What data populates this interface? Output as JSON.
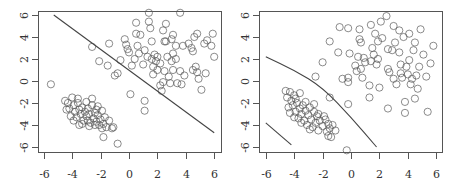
{
  "chart_data": [
    {
      "type": "scatter",
      "title": "",
      "xlabel": "",
      "ylabel": "",
      "xlim": [
        -6.5,
        6.5
      ],
      "ylim": [
        -6.5,
        6.5
      ],
      "xticks": [
        -6,
        -4,
        -2,
        0,
        2,
        4,
        6
      ],
      "yticks": [
        -6,
        -4,
        -2,
        0,
        2,
        4,
        6
      ],
      "grid": false,
      "legend": null,
      "marker": "open-circle",
      "marker_color": "#555555",
      "series": [
        {
          "name": "cluster-A",
          "description": "tight elongated cluster centered near (-3,-3)",
          "points": [
            [
              -4.5,
              -1.8
            ],
            [
              -4.3,
              -2.0
            ],
            [
              -4.2,
              -2.5
            ],
            [
              -4.0,
              -1.5
            ],
            [
              -3.9,
              -2.2
            ],
            [
              -3.8,
              -2.8
            ],
            [
              -3.7,
              -3.3
            ],
            [
              -3.6,
              -2.0
            ],
            [
              -3.5,
              -2.6
            ],
            [
              -3.4,
              -3.0
            ],
            [
              -3.3,
              -2.4
            ],
            [
              -3.2,
              -3.6
            ],
            [
              -3.1,
              -2.8
            ],
            [
              -3.0,
              -3.2
            ],
            [
              -2.9,
              -2.5
            ],
            [
              -2.8,
              -3.0
            ],
            [
              -2.7,
              -3.8
            ],
            [
              -2.6,
              -2.2
            ],
            [
              -2.5,
              -3.4
            ],
            [
              -2.4,
              -2.9
            ],
            [
              -2.3,
              -3.7
            ],
            [
              -2.2,
              -3.1
            ],
            [
              -2.1,
              -4.0
            ],
            [
              -2.0,
              -3.5
            ],
            [
              -1.9,
              -2.7
            ],
            [
              -1.8,
              -3.9
            ],
            [
              -1.7,
              -3.3
            ],
            [
              -1.6,
              -4.2
            ],
            [
              -1.4,
              -3.6
            ],
            [
              -1.2,
              -4.3
            ],
            [
              -1.1,
              -4.2
            ],
            [
              -4.1,
              -3.2
            ],
            [
              -3.9,
              -3.6
            ],
            [
              -3.6,
              -1.6
            ],
            [
              -3.3,
              -3.9
            ],
            [
              -3.0,
              -1.9
            ],
            [
              -2.8,
              -4.1
            ],
            [
              -2.6,
              -1.6
            ],
            [
              -2.4,
              -4.0
            ],
            [
              -2.2,
              -2.3
            ],
            [
              -1.9,
              -4.3
            ],
            [
              -4.4,
              -2.6
            ],
            [
              -3.5,
              -4.0
            ],
            [
              -2.9,
              -3.6
            ],
            [
              -2.3,
              -2.6
            ],
            [
              -1.8,
              -5.1
            ],
            [
              -0.8,
              -5.7
            ],
            [
              -5.5,
              -0.3
            ]
          ]
        },
        {
          "name": "cluster-B",
          "description": "diffuse cluster centered near (2.5,2.5)",
          "points": [
            [
              -2.6,
              3.1
            ],
            [
              -2.1,
              1.8
            ],
            [
              -1.5,
              1.4
            ],
            [
              -1.4,
              3.4
            ],
            [
              -1.0,
              0.5
            ],
            [
              -0.8,
              0.7
            ],
            [
              -0.6,
              1.9
            ],
            [
              -0.3,
              3.8
            ],
            [
              -0.2,
              3.3
            ],
            [
              -0.1,
              2.9
            ],
            [
              0.0,
              2.6
            ],
            [
              0.1,
              -1.2
            ],
            [
              0.2,
              1.4
            ],
            [
              0.4,
              2.0
            ],
            [
              0.5,
              5.3
            ],
            [
              0.5,
              4.3
            ],
            [
              0.6,
              3.2
            ],
            [
              0.7,
              2.5
            ],
            [
              0.8,
              4.2
            ],
            [
              1.0,
              1.5
            ],
            [
              1.1,
              2.8
            ],
            [
              1.1,
              -1.8
            ],
            [
              1.1,
              -2.7
            ],
            [
              1.3,
              2.2
            ],
            [
              1.4,
              6.2
            ],
            [
              1.4,
              5.4
            ],
            [
              1.5,
              4.8
            ],
            [
              1.6,
              3.6
            ],
            [
              1.6,
              2.0
            ],
            [
              1.7,
              1.3
            ],
            [
              1.7,
              0.6
            ],
            [
              1.8,
              2.4
            ],
            [
              1.9,
              1.8
            ],
            [
              2.0,
              2.2
            ],
            [
              2.0,
              1.0
            ],
            [
              2.2,
              1.6
            ],
            [
              2.2,
              -0.4
            ],
            [
              2.3,
              -0.9
            ],
            [
              2.4,
              -0.1
            ],
            [
              2.4,
              4.6
            ],
            [
              2.5,
              3.6
            ],
            [
              2.5,
              0.9
            ],
            [
              2.6,
              5.2
            ],
            [
              2.6,
              3.6
            ],
            [
              2.7,
              2.2
            ],
            [
              2.8,
              0.4
            ],
            [
              2.9,
              -0.2
            ],
            [
              3.0,
              3.8
            ],
            [
              3.0,
              1.8
            ],
            [
              3.1,
              4.2
            ],
            [
              3.1,
              2.5
            ],
            [
              3.1,
              1.0
            ],
            [
              3.3,
              3.2
            ],
            [
              3.3,
              2.0
            ],
            [
              3.4,
              -0.2
            ],
            [
              3.6,
              6.2
            ],
            [
              3.6,
              0.9
            ],
            [
              3.7,
              -0.3
            ],
            [
              3.8,
              3.2
            ],
            [
              3.9,
              0.5
            ],
            [
              4.2,
              3.4
            ],
            [
              4.4,
              3.0
            ],
            [
              4.5,
              2.7
            ],
            [
              4.5,
              1.0
            ],
            [
              4.6,
              4.0
            ],
            [
              4.7,
              1.3
            ],
            [
              4.8,
              4.3
            ],
            [
              4.8,
              0.8
            ],
            [
              4.9,
              0.2
            ],
            [
              5.1,
              -0.8
            ],
            [
              5.3,
              3.4
            ],
            [
              5.4,
              0.7
            ],
            [
              5.5,
              3.7
            ],
            [
              5.8,
              3.2
            ],
            [
              5.9,
              4.3
            ],
            [
              6.0,
              2.2
            ]
          ]
        }
      ],
      "lines": [
        {
          "name": "decision-boundary",
          "style": "solid",
          "points": [
            [
              -5.3,
              6.0
            ],
            [
              6.0,
              -4.7
            ]
          ]
        }
      ]
    },
    {
      "type": "scatter",
      "title": "",
      "xlabel": "",
      "ylabel": "",
      "xlim": [
        -6.5,
        6.5
      ],
      "ylim": [
        -6.5,
        6.5
      ],
      "xticks": [
        -6,
        -4,
        -2,
        0,
        2,
        4,
        6
      ],
      "yticks": [
        -6,
        -4,
        -2,
        0,
        2,
        4,
        6
      ],
      "grid": false,
      "legend": null,
      "marker": "open-circle",
      "marker_color": "#555555",
      "series": [
        {
          "name": "cluster-A",
          "description": "tight elongated cluster centered near (-3,-3)",
          "points": [
            [
              -4.6,
              -0.9
            ],
            [
              -4.5,
              -1.5
            ],
            [
              -4.4,
              -2.4
            ],
            [
              -4.3,
              -1.0
            ],
            [
              -4.2,
              -1.8
            ],
            [
              -4.1,
              -2.2
            ],
            [
              -4.0,
              -1.3
            ],
            [
              -3.9,
              -2.8
            ],
            [
              -3.8,
              -2.0
            ],
            [
              -3.7,
              -3.4
            ],
            [
              -3.6,
              -2.5
            ],
            [
              -3.5,
              -3.0
            ],
            [
              -3.4,
              -2.2
            ],
            [
              -3.3,
              -3.6
            ],
            [
              -3.2,
              -2.7
            ],
            [
              -3.1,
              -4.0
            ],
            [
              -3.0,
              -3.1
            ],
            [
              -2.9,
              -2.4
            ],
            [
              -2.8,
              -3.5
            ],
            [
              -2.7,
              -4.2
            ],
            [
              -2.6,
              -2.8
            ],
            [
              -2.5,
              -3.8
            ],
            [
              -2.4,
              -3.2
            ],
            [
              -2.3,
              -4.5
            ],
            [
              -2.2,
              -3.6
            ],
            [
              -2.0,
              -4.1
            ],
            [
              -1.8,
              -3.5
            ],
            [
              -1.7,
              -4.6
            ],
            [
              -1.6,
              -3.9
            ],
            [
              -1.5,
              -4.3
            ],
            [
              -1.4,
              -5.1
            ],
            [
              -1.3,
              -4.0
            ],
            [
              -1.1,
              -4.5
            ],
            [
              -4.3,
              -2.9
            ],
            [
              -3.9,
              -1.6
            ],
            [
              -3.5,
              -3.8
            ],
            [
              -3.2,
              -1.9
            ],
            [
              -2.9,
              -4.4
            ],
            [
              -2.6,
              -2.1
            ],
            [
              -2.3,
              -3.0
            ],
            [
              -1.9,
              -3.2
            ],
            [
              -1.6,
              -5.0
            ],
            [
              -3.6,
              -1.1
            ],
            [
              -4.0,
              -3.3
            ]
          ]
        },
        {
          "name": "cluster-B",
          "description": "diffuse cluster centered near (2.5,2.5)",
          "points": [
            [
              -2.5,
              0.4
            ],
            [
              -2.0,
              1.7
            ],
            [
              -1.5,
              3.6
            ],
            [
              -1.5,
              -1.5
            ],
            [
              -0.9,
              2.6
            ],
            [
              -0.8,
              4.9
            ],
            [
              -0.6,
              0.2
            ],
            [
              -0.2,
              0.3
            ],
            [
              -0.2,
              -0.1
            ],
            [
              -0.2,
              4.8
            ],
            [
              -0.1,
              2.5
            ],
            [
              -0.2,
              -2.1
            ],
            [
              -0.3,
              -6.3
            ],
            [
              0.3,
              1.4
            ],
            [
              0.4,
              0.9
            ],
            [
              0.5,
              2.2
            ],
            [
              0.6,
              4.7
            ],
            [
              0.6,
              3.8
            ],
            [
              0.7,
              3.5
            ],
            [
              0.7,
              1.1
            ],
            [
              0.8,
              0.3
            ],
            [
              0.9,
              2.1
            ],
            [
              1.0,
              1.7
            ],
            [
              1.3,
              -0.4
            ],
            [
              1.3,
              -1.5
            ],
            [
              1.4,
              5.1
            ],
            [
              1.4,
              1.8
            ],
            [
              1.5,
              3.0
            ],
            [
              1.6,
              2.4
            ],
            [
              1.7,
              4.3
            ],
            [
              1.8,
              1.5
            ],
            [
              1.9,
              2.0
            ],
            [
              1.9,
              3.6
            ],
            [
              2.0,
              -0.6
            ],
            [
              2.1,
              5.4
            ],
            [
              2.2,
              3.9
            ],
            [
              2.5,
              5.9
            ],
            [
              2.6,
              2.9
            ],
            [
              2.6,
              1.1
            ],
            [
              2.6,
              -2.5
            ],
            [
              2.7,
              0.8
            ],
            [
              2.9,
              2.8
            ],
            [
              3.0,
              5.0
            ],
            [
              3.0,
              0.2
            ],
            [
              3.1,
              3.5
            ],
            [
              3.2,
              -0.3
            ],
            [
              3.4,
              4.6
            ],
            [
              3.4,
              2.6
            ],
            [
              3.5,
              1.5
            ],
            [
              3.5,
              0.7
            ],
            [
              3.6,
              0.3
            ],
            [
              3.7,
              4.0
            ],
            [
              3.8,
              -1.9
            ],
            [
              3.8,
              -2.9
            ],
            [
              3.9,
              1.3
            ],
            [
              4.0,
              0.6
            ],
            [
              4.1,
              4.3
            ],
            [
              4.1,
              1.9
            ],
            [
              4.2,
              -0.3
            ],
            [
              4.3,
              0.2
            ],
            [
              4.4,
              2.8
            ],
            [
              4.5,
              3.5
            ],
            [
              4.5,
              -1.6
            ],
            [
              4.6,
              0.5
            ],
            [
              4.7,
              -0.7
            ],
            [
              4.8,
              1.3
            ],
            [
              4.9,
              4.7
            ],
            [
              5.1,
              2.4
            ],
            [
              5.3,
              0.4
            ],
            [
              5.4,
              -2.8
            ],
            [
              5.6,
              1.6
            ],
            [
              5.8,
              3.2
            ]
          ]
        }
      ],
      "lines": [
        {
          "name": "decision-boundary-upper",
          "style": "solid",
          "curve": true,
          "points": [
            [
              -6.0,
              2.2
            ],
            [
              -4.0,
              1.0
            ],
            [
              -2.0,
              -0.6
            ],
            [
              0.0,
              -3.3
            ],
            [
              1.8,
              -6.0
            ]
          ]
        },
        {
          "name": "decision-boundary-lower",
          "style": "solid",
          "points": [
            [
              -6.0,
              -3.8
            ],
            [
              -4.2,
              -5.8
            ]
          ]
        }
      ]
    }
  ],
  "panels": [
    {
      "frame": {
        "x": 38,
        "y": 11,
        "w": 183,
        "h": 141
      },
      "x0px": 129,
      "xscale": 14.2,
      "y0px": 81,
      "yscale": 11.0
    },
    {
      "frame": {
        "x": 259,
        "y": 11,
        "w": 183,
        "h": 141
      },
      "x0px": 351,
      "xscale": 14.2,
      "y0px": 81,
      "yscale": 11.0
    }
  ]
}
